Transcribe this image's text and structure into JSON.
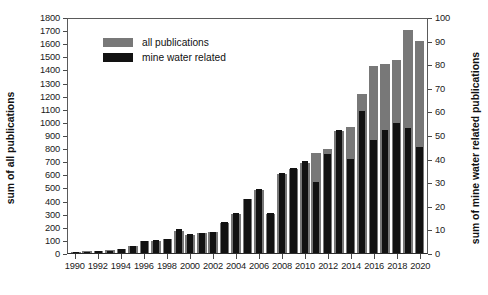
{
  "chart_data": {
    "type": "bar",
    "title": "",
    "xlabel": "",
    "ylabel": "sum of all publications",
    "y2label": "sum of mine water related publications",
    "ylim": [
      0,
      1800
    ],
    "y2lim": [
      0,
      100
    ],
    "grid": false,
    "legend_position": "top-left",
    "yticks": [
      0,
      100,
      200,
      300,
      400,
      500,
      600,
      700,
      800,
      900,
      1000,
      1100,
      1200,
      1300,
      1400,
      1500,
      1600,
      1700,
      1800
    ],
    "y2ticks": [
      0,
      10,
      20,
      30,
      40,
      50,
      60,
      70,
      80,
      90,
      100
    ],
    "categories": [
      1990,
      1991,
      1992,
      1993,
      1994,
      1995,
      1996,
      1997,
      1998,
      1999,
      2000,
      2001,
      2002,
      2003,
      2004,
      2005,
      2006,
      2007,
      2008,
      2009,
      2010,
      2011,
      2012,
      2013,
      2014,
      2015,
      2016,
      2017,
      2018,
      2019,
      2020
    ],
    "xtick_labels": [
      "1990",
      "",
      "1992",
      "",
      "1994",
      "",
      "1996",
      "",
      "1998",
      "",
      "2000",
      "",
      "2002",
      "",
      "2004",
      "",
      "2006",
      "",
      "2008",
      "",
      "2010",
      "",
      "2012",
      "",
      "2014",
      "",
      "2016",
      "",
      "2018",
      "",
      "2020"
    ],
    "series": [
      {
        "name": "all publications",
        "color": "#787878",
        "axis": "left",
        "values": [
          10,
          12,
          14,
          20,
          30,
          55,
          90,
          95,
          105,
          170,
          140,
          150,
          160,
          230,
          300,
          410,
          480,
          300,
          600,
          640,
          690,
          760,
          790,
          930,
          960,
          1210,
          1430,
          1440,
          1470,
          1700,
          1620
        ]
      },
      {
        "name": "mine water related",
        "color": "#121212",
        "axis": "right",
        "values": [
          0.5,
          0.6,
          0.8,
          1,
          1.5,
          3,
          5,
          5.5,
          6,
          10,
          8,
          8.5,
          9,
          13,
          17,
          23,
          27,
          17,
          34,
          36,
          39,
          30,
          42,
          52,
          40,
          60,
          48,
          52,
          55,
          53,
          45
        ]
      }
    ]
  },
  "legend": {
    "items": [
      {
        "label": "all publications",
        "swatch": "gray"
      },
      {
        "label": "mine water related",
        "swatch": "black"
      }
    ]
  },
  "colors": {
    "all_publications": "#787878",
    "mine_water_related": "#121212",
    "axis": "#4a4a4a",
    "text": "#111111",
    "background": "#ffffff"
  }
}
